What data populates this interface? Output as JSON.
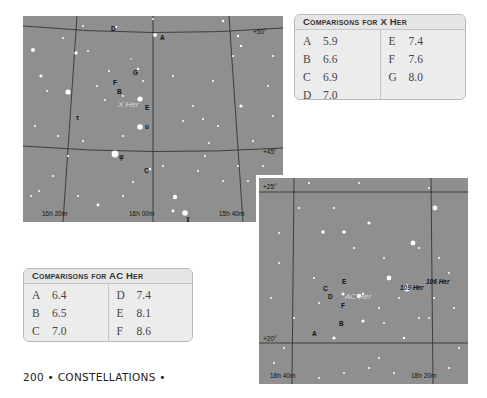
{
  "chart_x_her": {
    "variable_label": "X Her",
    "declination_labels": [
      "+50°",
      "+45°"
    ],
    "ra_labels": [
      "16h 20m",
      "16h 00m",
      "15h 40m"
    ],
    "comparison_labels": [
      "A",
      "B",
      "C",
      "D",
      "E",
      "F",
      "G"
    ],
    "greek_labels": [
      "τ",
      "υ",
      "φ",
      "χ"
    ]
  },
  "table_x_her": {
    "title": "Comparisons for X Her",
    "left_column": [
      {
        "star": "A",
        "mag": "5.9"
      },
      {
        "star": "B",
        "mag": "6.6"
      },
      {
        "star": "C",
        "mag": "6.9"
      },
      {
        "star": "D",
        "mag": "7.0"
      }
    ],
    "right_column": [
      {
        "star": "E",
        "mag": "7.4"
      },
      {
        "star": "F",
        "mag": "7.6"
      },
      {
        "star": "G",
        "mag": "8.0"
      }
    ]
  },
  "chart_ac_her": {
    "variable_label": "AC Her",
    "declination_labels": [
      "+25°",
      "+20°"
    ],
    "ra_labels": [
      "18h 40m",
      "18h 20m"
    ],
    "comparison_labels": [
      "A",
      "B",
      "C",
      "D",
      "E",
      "F"
    ],
    "named_stars": [
      "109 Her",
      "106 Her"
    ]
  },
  "table_ac_her": {
    "title": "Comparisons for AC Her",
    "left_column": [
      {
        "star": "A",
        "mag": "6.4"
      },
      {
        "star": "B",
        "mag": "6.5"
      },
      {
        "star": "C",
        "mag": "7.0"
      }
    ],
    "right_column": [
      {
        "star": "D",
        "mag": "7.4"
      },
      {
        "star": "E",
        "mag": "8.1"
      },
      {
        "star": "F",
        "mag": "8.6"
      }
    ]
  },
  "footer": {
    "page_number": "200",
    "section": "• CONSTELLATIONS •"
  }
}
